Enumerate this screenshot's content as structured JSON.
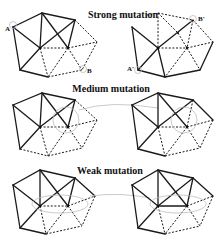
{
  "panels": [
    {
      "id": "strong",
      "title": "Strong mutation",
      "labels": {
        "left_A": "A",
        "left_B": "B",
        "right_A": "A'",
        "right_B": "B'"
      }
    },
    {
      "id": "medium",
      "title": "Medium mutation"
    },
    {
      "id": "weak",
      "title": "Weak mutation"
    }
  ],
  "colors": {
    "edge": "#1a1a1a",
    "highlight_circle": "#bdbdbd",
    "background": "#ffffff"
  }
}
